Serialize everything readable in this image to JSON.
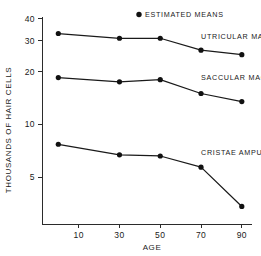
{
  "chart_data": {
    "type": "line",
    "title": "",
    "xlabel": "AGE",
    "ylabel": "THOUSANDS OF HAIR CELLS",
    "x": [
      0,
      30,
      50,
      70,
      90
    ],
    "xticks": [
      10,
      30,
      50,
      70,
      90
    ],
    "xticklabels": [
      "10",
      "30",
      "50",
      "70",
      "90"
    ],
    "xlim": [
      -8,
      95
    ],
    "yscale": "log",
    "yticks": [
      5,
      10,
      20,
      30,
      40
    ],
    "yticklabels": [
      "5",
      "10",
      "20",
      "30",
      "40"
    ],
    "ylim": [
      2.7,
      41
    ],
    "grid": false,
    "legend_position": "top-right",
    "legend": [
      {
        "label": "ESTIMATED MEANS",
        "marker": "filled-circle"
      }
    ],
    "series": [
      {
        "name": "UTRICULAR MACULA",
        "label": "UTRICULAR MACULA",
        "values": [
          33.0,
          31.0,
          31.0,
          26.5,
          25.0
        ],
        "label_x": 70,
        "label_y": 30.5
      },
      {
        "name": "SACCULAR MACULA",
        "label": "SACCULAR MACULA",
        "values": [
          18.5,
          17.5,
          18.0,
          15.0,
          13.5
        ],
        "label_x": 70,
        "label_y": 17.6
      },
      {
        "name": "CRISTAE AMPULLA",
        "label": "CRISTAE AMPULLA",
        "values": [
          7.7,
          6.7,
          6.6,
          5.7,
          3.4
        ],
        "label_x": 70,
        "label_y": 6.6
      }
    ]
  }
}
